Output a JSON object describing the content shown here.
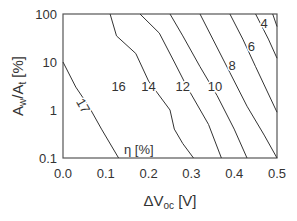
{
  "chart_data": {
    "type": "contour",
    "title": "",
    "xlabel": "ΔVoc [V]",
    "ylabel": "Aw/At [%]",
    "xlim": [
      0.0,
      0.5
    ],
    "ylim": [
      0.1,
      100
    ],
    "yscale": "log",
    "x_ticks": [
      "0.0",
      "0.1",
      "0.2",
      "0.3",
      "0.4",
      "0.5"
    ],
    "y_ticks": [
      "100",
      "10",
      "1",
      "0.1"
    ],
    "grid": false,
    "annotation": "η [%]",
    "contours": [
      {
        "level": 17,
        "points": [
          [
            0.0,
            10
          ],
          [
            0.03,
            3
          ],
          [
            0.06,
            1.2
          ],
          [
            0.09,
            0.4
          ],
          [
            0.13,
            0.1
          ]
        ]
      },
      {
        "level": 16,
        "points": [
          [
            0.11,
            100
          ],
          [
            0.125,
            35
          ],
          [
            0.17,
            15
          ],
          [
            0.2,
            4
          ],
          [
            0.25,
            1
          ],
          [
            0.26,
            0.4
          ],
          [
            0.28,
            0.2
          ],
          [
            0.305,
            0.1
          ]
        ]
      },
      {
        "level": 14,
        "points": [
          [
            0.18,
            100
          ],
          [
            0.225,
            40
          ],
          [
            0.26,
            10
          ],
          [
            0.29,
            3
          ],
          [
            0.34,
            0.5
          ],
          [
            0.37,
            0.1
          ]
        ]
      },
      {
        "level": 12,
        "points": [
          [
            0.25,
            100
          ],
          [
            0.28,
            35
          ],
          [
            0.32,
            8
          ],
          [
            0.36,
            2
          ],
          [
            0.4,
            0.4
          ],
          [
            0.43,
            0.1
          ]
        ]
      },
      {
        "level": 10,
        "points": [
          [
            0.32,
            100
          ],
          [
            0.35,
            30
          ],
          [
            0.39,
            6
          ],
          [
            0.43,
            1.2
          ],
          [
            0.47,
            0.3
          ],
          [
            0.5,
            0.1
          ]
        ]
      },
      {
        "level": 8,
        "points": [
          [
            0.39,
            100
          ],
          [
            0.42,
            30
          ],
          [
            0.45,
            8
          ],
          [
            0.5,
            0.9
          ]
        ]
      },
      {
        "level": 6,
        "points": [
          [
            0.45,
            100
          ],
          [
            0.48,
            30
          ],
          [
            0.5,
            12
          ]
        ]
      },
      {
        "level": 4,
        "points": [
          [
            0.49,
            100
          ],
          [
            0.5,
            55
          ]
        ]
      }
    ],
    "contour_labels": [
      {
        "text": "17",
        "x": 0.045,
        "y": 1.2,
        "rotation": 60
      },
      {
        "text": "16",
        "x": 0.13,
        "y": 3.0
      },
      {
        "text": "14",
        "x": 0.2,
        "y": 3.0
      },
      {
        "text": "12",
        "x": 0.28,
        "y": 3.0
      },
      {
        "text": "10",
        "x": 0.355,
        "y": 3.0
      },
      {
        "text": "8",
        "x": 0.395,
        "y": 8.0
      },
      {
        "text": "6",
        "x": 0.44,
        "y": 20
      },
      {
        "text": "4",
        "x": 0.47,
        "y": 60
      }
    ]
  },
  "labels": {
    "y_axis_main": "A",
    "y_sub_w": "w",
    "y_mid": "/A",
    "y_sub_t": "t",
    "y_unit": " [%]",
    "x_axis_main": "ΔV",
    "x_sub": "oc",
    "x_unit": " [V]",
    "eta": "η [%]"
  }
}
